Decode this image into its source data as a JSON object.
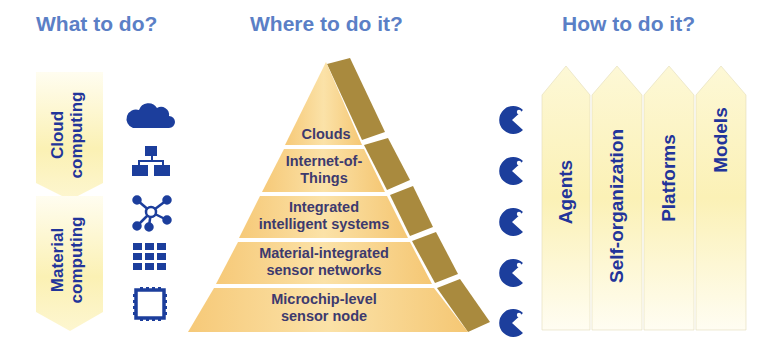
{
  "headers": {
    "what": "What to do?",
    "where": "Where to do it?",
    "how": "How to do it?"
  },
  "what_arrows": [
    {
      "line1": "Cloud",
      "line2": "computing"
    },
    {
      "line1": "Material",
      "line2": "computing"
    }
  ],
  "icons": [
    "cloud-icon",
    "network-hierarchy-icon",
    "hub-nodes-icon",
    "grid-icon",
    "microchip-frame-icon"
  ],
  "pyramid": {
    "levels": [
      {
        "line1": "Clouds",
        "line2": ""
      },
      {
        "line1": "Internet-of-",
        "line2": "Things"
      },
      {
        "line1": "Integrated",
        "line2": "intelligent systems"
      },
      {
        "line1": "Material-integrated",
        "line2": "sensor networks"
      },
      {
        "line1": "Microchip-level",
        "line2": "sensor node"
      }
    ]
  },
  "agents_count": 5,
  "how_columns": [
    {
      "label": "Agents"
    },
    {
      "label": "Self-organization"
    },
    {
      "label": "Platforms"
    },
    {
      "label": "Models"
    }
  ],
  "colors": {
    "header": "#5b7fc6",
    "icon_blue": "#1c3e9c",
    "text_navy": "#22349a",
    "pyramid_fill": "#f7d38a",
    "pyramid_side": "#a98a3e",
    "arrow_fill": "#fbf3bd"
  }
}
